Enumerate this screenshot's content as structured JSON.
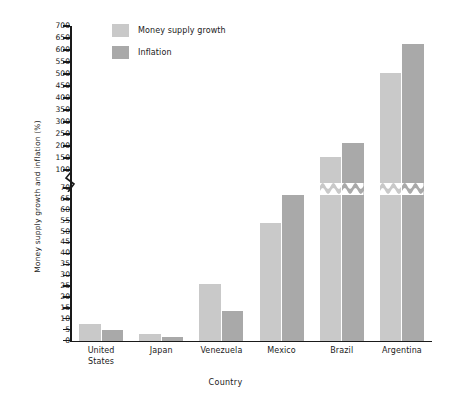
{
  "chart_data": {
    "type": "bar",
    "title": "",
    "xlabel": "Country",
    "ylabel": "Money supply growth and inflation (%)",
    "categories": [
      "United States",
      "Japan",
      "Venezuela",
      "Mexico",
      "Brazil",
      "Argentina"
    ],
    "category_lines": [
      [
        "United",
        "States"
      ],
      [
        "Japan"
      ],
      [
        "Venezuela"
      ],
      [
        "Mexico"
      ],
      [
        "Brazil"
      ],
      [
        "Argentina"
      ]
    ],
    "series": [
      {
        "name": "Money supply growth",
        "color": "#c9c9c9",
        "values": [
          8,
          3,
          26,
          54,
          155,
          505
        ]
      },
      {
        "name": "Inflation",
        "color": "#a9a9a9",
        "values": [
          5,
          2,
          14,
          67,
          215,
          627
        ]
      }
    ],
    "legend_position": "top-left",
    "grid": false,
    "axis_break": {
      "below": 70,
      "above": 100,
      "note": "y-axis is broken between 70 and 100"
    },
    "ylim": [
      0,
      700
    ],
    "yticks_lower": [
      0,
      5,
      10,
      15,
      20,
      25,
      30,
      35,
      40,
      45,
      50,
      55,
      60,
      65,
      70
    ],
    "yticks_upper": [
      100,
      150,
      200,
      250,
      300,
      350,
      400,
      450,
      500,
      550,
      600,
      650,
      700
    ],
    "ytick_labels": [
      "0",
      "5",
      "10",
      "15",
      "20",
      "25",
      "30",
      "35",
      "40",
      "45",
      "50",
      "55",
      "60",
      "65",
      "70",
      "100",
      "150",
      "200",
      "250",
      "300",
      "350",
      "400",
      "450",
      "500",
      "550",
      "600",
      "650",
      "700"
    ]
  },
  "colors": {
    "money_supply_growth": "#c9c9c9",
    "inflation": "#a9a9a9",
    "axis": "#1a1a1a",
    "background": "#ffffff"
  }
}
